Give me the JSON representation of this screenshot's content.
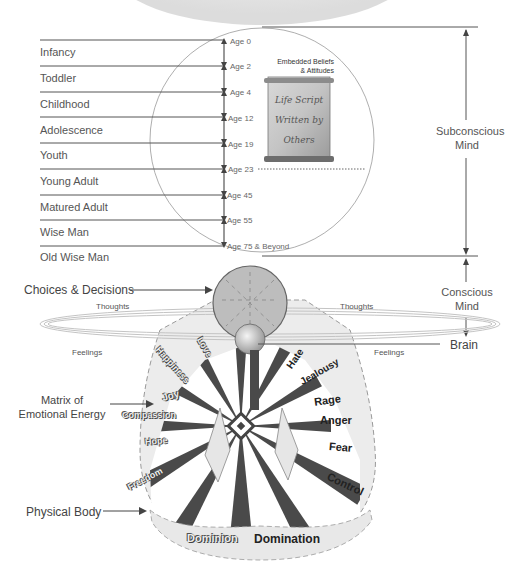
{
  "life_stages": [
    {
      "label": "Infancy",
      "age_start": "Age 0"
    },
    {
      "label": "Toddler",
      "age_start": "Age 2"
    },
    {
      "label": "Childhood",
      "age_start": "Age 4"
    },
    {
      "label": "Adolescence",
      "age_start": "Age 12"
    },
    {
      "label": "Youth",
      "age_start": "Age 19"
    },
    {
      "label": "Young Adult",
      "age_start": "Age 23"
    },
    {
      "label": "Matured Adult",
      "age_start": "Age 45"
    },
    {
      "label": "Wise Man",
      "age_start": "Age 55"
    },
    {
      "label": "Old Wise Man",
      "age_start": "Age 75 & Beyond"
    }
  ],
  "ages": [
    "Age 0",
    "Age 2",
    "Age 4",
    "Age 12",
    "Age 19",
    "Age 23",
    "Age 45",
    "Age 55",
    "Age 75 & Beyond"
  ],
  "beliefs": {
    "heading_line1": "Embedded Beliefs",
    "heading_line2": "& Attitudes",
    "scroll_line1": "Life Script",
    "scroll_line2": "Written by",
    "scroll_line3": "Others"
  },
  "right_labels": {
    "subconscious_line1": "Subconscious",
    "subconscious_line2": "Mind",
    "conscious_line1": "Conscious",
    "conscious_line2": "Mind",
    "brain": "Brain"
  },
  "left_labels": {
    "choices": "Choices & Decisions",
    "matrix_line1": "Matrix of",
    "matrix_line2": "Emotional Energy",
    "physical_body": "Physical Body"
  },
  "orbit_labels": {
    "thoughts_left": "Thoughts",
    "thoughts_right": "Thoughts",
    "feelings_left": "Feelings",
    "feelings_right": "Feelings"
  },
  "positive_emotions": [
    "Love",
    "Happiness",
    "Joy",
    "Compassion",
    "Hope",
    "Freedom",
    "Dominion"
  ],
  "negative_emotions": [
    "Hate",
    "Jealousy",
    "Rage",
    "Anger",
    "Fear",
    "Control",
    "Domination"
  ],
  "colors": {
    "line": "#555555",
    "circle_fill_mind": "#bdbdbd",
    "ray_dark": "#4a4a4a",
    "matrix_fill": "#ececec"
  }
}
